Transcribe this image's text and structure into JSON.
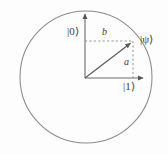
{
  "labels": {
    "ket_zero": "|0⟩",
    "ket_one": "|1⟩",
    "ket_psi": "|ψ⟩",
    "amplitude_b": "b",
    "amplitude_a": "a"
  },
  "icons": {
    "circle": "unit-circle",
    "axis_vertical": "axis-arrow-up",
    "axis_horizontal": "axis-arrow-right",
    "state_vector": "state-vector-arrow",
    "projection_horizontal": "dashed-projection-line",
    "projection_vertical": "dashed-projection-line"
  },
  "colors": {
    "background": "#fdfdfd",
    "circle_stroke": "#8a8a8a",
    "axis_stroke": "#6b6b6b",
    "vector_stroke": "#5a5a5a",
    "dashed_stroke": "#8f8f8f",
    "label_text": "#3b3b3b"
  },
  "geometry": {
    "circle_center_x": 86,
    "circle_center_y": 77,
    "circle_radius": 66,
    "origin_x": 85,
    "origin_y": 78,
    "state_point_x": 133,
    "state_point_y": 41,
    "vertical_axis_tip_y": 11,
    "horizontal_axis_tip_x": 147
  }
}
